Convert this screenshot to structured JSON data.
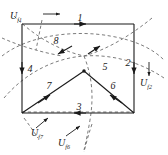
{
  "figure": {
    "name": "boundary-condition-diagram",
    "colors": {
      "solid_line": "#1a1a1a",
      "dashed_line": "#555555",
      "text": "#1a1a1a",
      "background": "#ffffff"
    },
    "segment_labels": [
      {
        "id": "1",
        "text": "1",
        "x": 80,
        "y": 21
      },
      {
        "id": "2",
        "text": "2",
        "x": 134,
        "y": 66
      },
      {
        "id": "3",
        "text": "3",
        "x": 77,
        "y": 112
      },
      {
        "id": "4",
        "text": "4",
        "x": 25,
        "y": 72
      },
      {
        "id": "5",
        "text": "5",
        "x": 103,
        "y": 68
      },
      {
        "id": "6",
        "text": "6",
        "x": 113,
        "y": 90
      },
      {
        "id": "7",
        "text": "7",
        "x": 49,
        "y": 90
      },
      {
        "id": "8",
        "text": "8",
        "x": 55,
        "y": 42
      }
    ],
    "potential_labels": [
      {
        "id": "U-f1",
        "base": "U",
        "sub": "f1",
        "x": 12,
        "y": 17
      },
      {
        "id": "U-f2",
        "base": "U",
        "sub": "f2",
        "x": 142,
        "y": 82
      },
      {
        "id": "U-f7",
        "base": "U",
        "sub": "f7",
        "x": 35,
        "y": 136
      },
      {
        "id": "U-f6",
        "base": "U",
        "sub": "f6",
        "x": 62,
        "y": 146
      }
    ]
  }
}
